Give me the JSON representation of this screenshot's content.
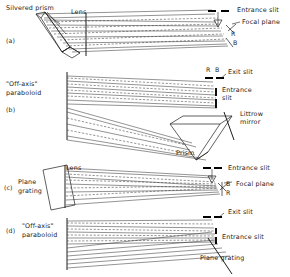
{
  "figure": {
    "background_color": "#ffffff",
    "ink_color": "#222222",
    "ray_color": "#3a3a3a"
  },
  "panels": [
    {
      "id": "a",
      "label": "(a)",
      "type": "prism-spectrograph",
      "labels": {
        "dispersing_element": "Silvered prism",
        "focusing_element": "Lens",
        "entrance_slit": "Entrance slit",
        "focal_plane": "Focal plane",
        "red_marker": "R",
        "blue_marker": "B"
      }
    },
    {
      "id": "b",
      "label": "(b)",
      "type": "littrow-prism-spectrograph",
      "labels": {
        "focusing_element_line1": "\"Off-axis\"",
        "focusing_element_line2": "paraboloid",
        "exit_slit": "Exit slit",
        "entrance_slit_line1": "Entrance",
        "entrance_slit_line2": "slit",
        "littrow_line1": "Littrow",
        "littrow_line2": "mirror",
        "prism": "Prism",
        "red_marker": "R",
        "blue_marker": "B"
      }
    },
    {
      "id": "c",
      "label": "(c)",
      "type": "plane-grating-spectrograph",
      "labels": {
        "dispersing_element_line1": "Plane",
        "dispersing_element_line2": "grating",
        "focusing_element": "Lens",
        "entrance_slit": "Entrance slit",
        "focal_plane": "Focal plane",
        "blue_marker": "B",
        "red_marker": "R"
      }
    },
    {
      "id": "d",
      "label": "(d)",
      "type": "offaxis-paraboloid-grating-spectrograph",
      "labels": {
        "focusing_element_line1": "\"Off-axis\"",
        "focusing_element_line2": "paraboloid",
        "exit_slit": "Exit slit",
        "entrance_slit": "Entrance slit",
        "dispersing_element": "Plane grating"
      }
    }
  ]
}
